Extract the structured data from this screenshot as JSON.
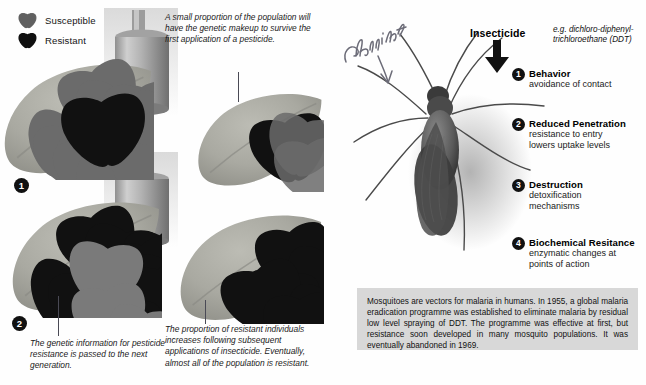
{
  "legend": {
    "items": [
      {
        "label": "Susceptible",
        "swatch": "susceptible-insect-icon",
        "color": "#6e6e6e"
      },
      {
        "label": "Resistant",
        "swatch": "resistant-insect-icon",
        "color": "#101010"
      }
    ]
  },
  "stages": [
    {
      "number": "1",
      "badge": "❶",
      "caption": "",
      "susceptible_count": 13,
      "resistant_count": 1
    },
    {
      "number": "2",
      "badge": "❷",
      "caption": "The genetic information for pesticide resistance is passed to the next generation.",
      "susceptible_count": 3,
      "resistant_count": 10
    }
  ],
  "captions": {
    "top_right": "A small proportion of the population will have the genetic makeup to survive the first application of a pesticide.",
    "bottom_left": "The genetic information for pesticide resistance is passed to the next generation.",
    "bottom_right": "The proportion of resistant individuals increases following subsequent applications of insecticide. Eventually, almost all of the population is resistant."
  },
  "insecticide": {
    "label": "Insecticide",
    "example": "e.g. dichloro-diphenyl-trichloroethane (DDT)",
    "arrow": "down-arrow-icon"
  },
  "mechanisms": [
    {
      "number": "1",
      "title": "Behavior",
      "detail": "avoidance of contact"
    },
    {
      "number": "2",
      "title": "Reduced Penetration",
      "detail": "resistance to entry\nlowers uptake levels"
    },
    {
      "number": "3",
      "title": "Destruction",
      "detail": "detoxification\nmechanisms"
    },
    {
      "number": "4",
      "title": "Biochemical Resitance",
      "detail": "enzymatic changes at\npoints of action"
    }
  ],
  "info_box": {
    "text": "Mosquitoes are vectors for malaria in humans. In 1955, a global malaria eradication programme was established to eliminate malaria by residual low level spraying of DDT. The programme was effective at first, but resistance soon developed in many mosquito populations. It was eventually abandoned in 1969."
  },
  "annotation": {
    "handwritten_text": "Christine",
    "arrow": "handwritten-down-arrow-icon"
  },
  "colors": {
    "resistant": "#101010",
    "susceptible": "#6e6e6e",
    "leaf": "#a8a8a2",
    "infobox_bg": "#d8d8d8",
    "badge_bg": "#111111"
  }
}
